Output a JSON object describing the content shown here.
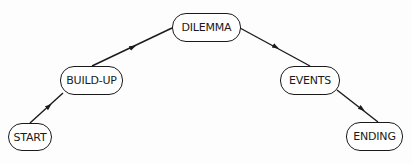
{
  "diagram": {
    "type": "story-arc",
    "nodes": [
      {
        "id": "start",
        "label": "START"
      },
      {
        "id": "build-up",
        "label": "BUILD-UP"
      },
      {
        "id": "dilemma",
        "label": "DILEMMA"
      },
      {
        "id": "events",
        "label": "EVENTS"
      },
      {
        "id": "ending",
        "label": "ENDING"
      }
    ],
    "edges": [
      {
        "from": "start",
        "to": "build-up"
      },
      {
        "from": "build-up",
        "to": "dilemma"
      },
      {
        "from": "dilemma",
        "to": "events"
      },
      {
        "from": "events",
        "to": "ending"
      }
    ],
    "colors": {
      "stroke": "#1a1a1a",
      "fill": "#ffffff",
      "background": "#fdfdfd"
    }
  }
}
